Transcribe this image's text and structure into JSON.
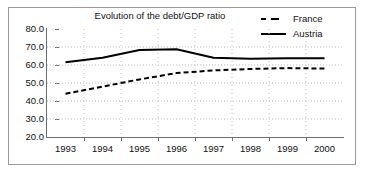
{
  "chart_data": {
    "type": "line",
    "title": "Evolution of the debt/GDP ratio",
    "xlabel": "",
    "ylabel": "",
    "x": [
      "1993",
      "1994",
      "1995",
      "1996",
      "1997",
      "1998",
      "1999",
      "2000"
    ],
    "categories": [
      "1993",
      "1994",
      "1995",
      "1996",
      "1997",
      "1998",
      "1999",
      "2000"
    ],
    "ylim": [
      20.0,
      80.0
    ],
    "y_ticks": [
      "80.0",
      "70.0",
      "60.0",
      "50.0",
      "40.0",
      "30.0",
      "20.0"
    ],
    "y_tick_values": [
      80.0,
      70.0,
      60.0,
      50.0,
      40.0,
      30.0,
      20.0
    ],
    "grid": true,
    "grid_style": "dotted-horizontal-and-vertical",
    "legend_position": "top-right",
    "series": [
      {
        "name": "France",
        "style": "dashed",
        "color": "#000000",
        "values": [
          44.0,
          48.0,
          52.0,
          55.5,
          57.0,
          57.8,
          58.3,
          58.0
        ]
      },
      {
        "name": "Austria",
        "style": "solid",
        "color": "#000000",
        "values": [
          61.5,
          64.0,
          68.3,
          68.7,
          64.0,
          63.5,
          63.8,
          63.8
        ]
      }
    ]
  },
  "legend": {
    "items": [
      {
        "label": "France",
        "style": "dashed"
      },
      {
        "label": "Austria",
        "style": "solid"
      }
    ]
  }
}
